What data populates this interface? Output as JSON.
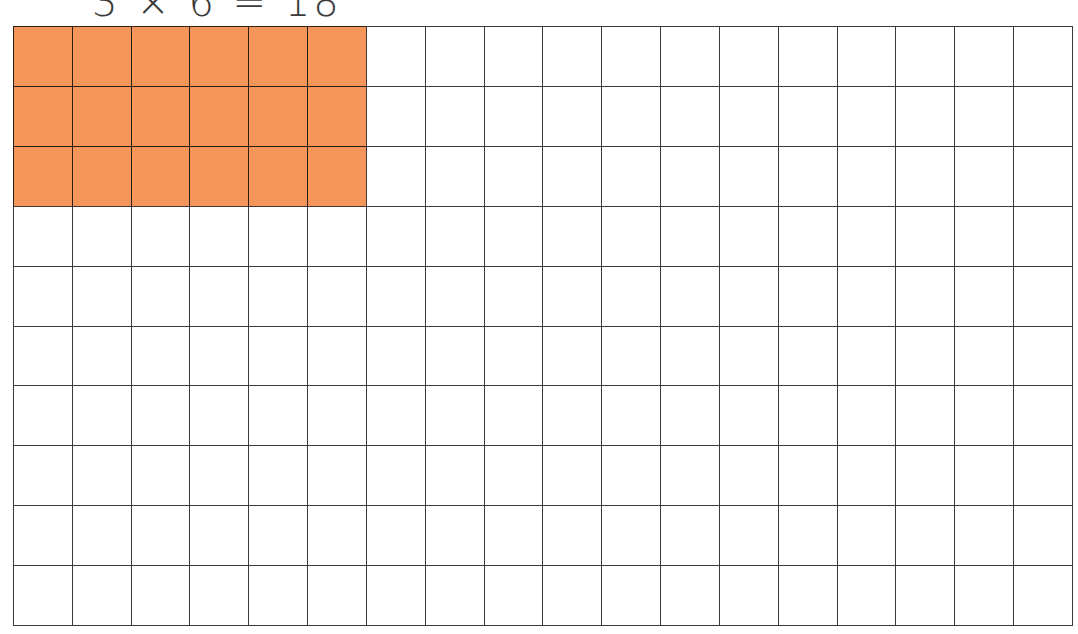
{
  "equation": {
    "text": "3 × 6 = 18",
    "factor_rows": 3,
    "factor_cols": 6,
    "product": 18
  },
  "grid": {
    "rows": 10,
    "cols": 18,
    "highlight": {
      "rows": 3,
      "cols": 6,
      "color": "#f4955a"
    },
    "line_color": "#3a3a3a",
    "background": "#ffffff"
  }
}
